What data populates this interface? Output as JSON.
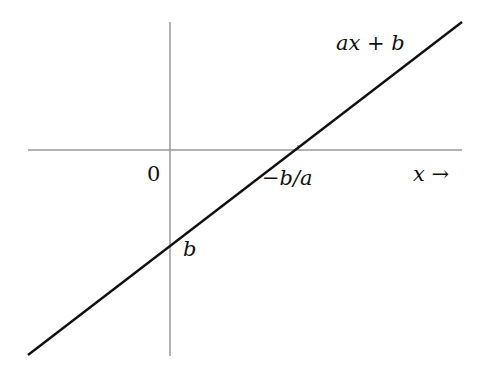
{
  "diagram": {
    "line_label": "ax + b",
    "origin_label": "0",
    "x_intercept_label": "−b/a",
    "y_intercept_label": "b",
    "x_axis_label": "x →",
    "colors": {
      "axes": "#999999",
      "line": "#111111",
      "text": "#111111"
    }
  }
}
